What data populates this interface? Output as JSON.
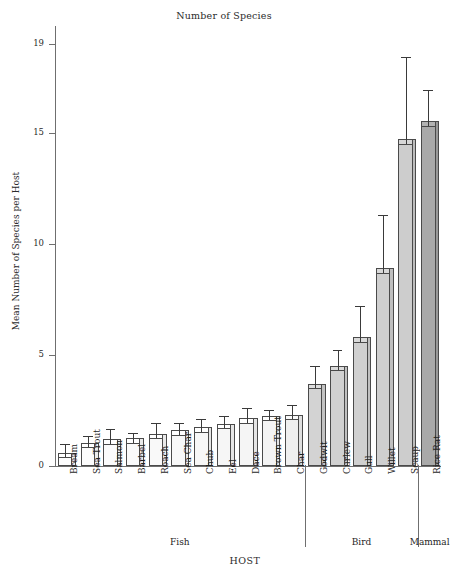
{
  "chart_data": {
    "type": "bar",
    "title": "Number of Species",
    "xlabel": "HOST",
    "ylabel": "Mean Number of Species per Host",
    "ylim": [
      0,
      19.8
    ],
    "yticks": [
      0,
      5,
      10,
      15,
      19
    ],
    "grid": false,
    "legend": "none",
    "categories": [
      "Bream",
      "Sea Trout",
      "Salmon",
      "Barbel",
      "Roach",
      "Sea Char",
      "Chub",
      "Eel",
      "Dace",
      "Brown Trout",
      "Char",
      "Godwit",
      "Curlew",
      "Gull",
      "Willet",
      "Scaup",
      "Rice Rat"
    ],
    "values": [
      0.4,
      0.85,
      1.0,
      1.05,
      1.25,
      1.4,
      1.55,
      1.7,
      1.95,
      2.05,
      2.1,
      3.5,
      4.3,
      5.6,
      8.7,
      14.5,
      15.3
    ],
    "error_high": [
      1.0,
      1.35,
      1.65,
      1.5,
      1.95,
      1.95,
      2.1,
      2.25,
      2.6,
      2.5,
      2.75,
      4.5,
      5.2,
      7.2,
      11.3,
      18.4,
      16.9
    ],
    "bars": [
      {
        "label": "Bream",
        "value": 0.4,
        "error_high": 1.0,
        "group": "Fish",
        "fill": "#fdfdfd"
      },
      {
        "label": "Sea Trout",
        "value": 0.85,
        "error_high": 1.35,
        "group": "Fish",
        "fill": "#fcfcfc"
      },
      {
        "label": "Salmon",
        "value": 1.0,
        "error_high": 1.65,
        "group": "Fish",
        "fill": "#fbfbfb"
      },
      {
        "label": "Barbel",
        "value": 1.05,
        "error_high": 1.5,
        "group": "Fish",
        "fill": "#fafafa"
      },
      {
        "label": "Roach",
        "value": 1.25,
        "error_high": 1.95,
        "group": "Fish",
        "fill": "#f9f9f9"
      },
      {
        "label": "Sea Char",
        "value": 1.4,
        "error_high": 1.95,
        "group": "Fish",
        "fill": "#f8f8f8"
      },
      {
        "label": "Chub",
        "value": 1.55,
        "error_high": 2.1,
        "group": "Fish",
        "fill": "#f7f7f7"
      },
      {
        "label": "Eel",
        "value": 1.7,
        "error_high": 2.25,
        "group": "Fish",
        "fill": "#f6f6f6"
      },
      {
        "label": "Dace",
        "value": 1.95,
        "error_high": 2.6,
        "group": "Fish",
        "fill": "#f5f5f5"
      },
      {
        "label": "Brown Trout",
        "value": 2.05,
        "error_high": 2.5,
        "group": "Fish",
        "fill": "#f4f4f4"
      },
      {
        "label": "Char",
        "value": 2.1,
        "error_high": 2.75,
        "group": "Fish",
        "fill": "#efefef"
      },
      {
        "label": "Godwit",
        "value": 3.5,
        "error_high": 4.5,
        "group": "Bird",
        "fill": "#d3d3d3"
      },
      {
        "label": "Curlew",
        "value": 4.3,
        "error_high": 5.2,
        "group": "Bird",
        "fill": "#d1d1d1"
      },
      {
        "label": "Gull",
        "value": 5.6,
        "error_high": 7.2,
        "group": "Bird",
        "fill": "#d0d0d0"
      },
      {
        "label": "Willet",
        "value": 8.7,
        "error_high": 11.3,
        "group": "Bird",
        "fill": "#cfcfcf"
      },
      {
        "label": "Scaup",
        "value": 14.5,
        "error_high": 18.4,
        "group": "Bird",
        "fill": "#cdcdcd"
      },
      {
        "label": "Rice Rat",
        "value": 15.3,
        "error_high": 16.9,
        "group": "Mammal",
        "fill": "#a9a9a9"
      }
    ],
    "groups": [
      {
        "name": "Fish",
        "start": 0,
        "end": 10
      },
      {
        "name": "Bird",
        "start": 11,
        "end": 15
      },
      {
        "name": "Mammal",
        "start": 16,
        "end": 16
      }
    ],
    "colors": {
      "axis": "#6f6f6f",
      "bar_edge": "#4a4a4a",
      "error_bar": "#3a3a3a",
      "text": "#1f1f1f"
    }
  }
}
